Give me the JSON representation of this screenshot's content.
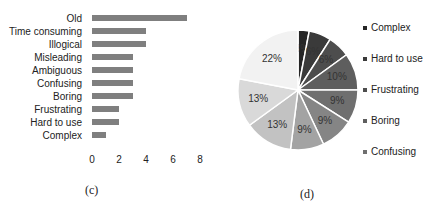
{
  "chart_data": [
    {
      "type": "bar",
      "orientation": "horizontal",
      "title": "",
      "xlabel": "",
      "ylabel": "",
      "categories": [
        "Old",
        "Time consuming",
        "Illogical",
        "Misleading",
        "Ambiguous",
        "Confusing",
        "Boring",
        "Frustrating",
        "Hard to use",
        "Complex"
      ],
      "values": [
        7,
        4,
        4,
        3,
        3,
        3,
        3,
        2,
        2,
        1
      ],
      "xlim": [
        0,
        8
      ],
      "xticks": [
        "0",
        "2",
        "4",
        "6",
        "8"
      ],
      "grid": false,
      "bar_color": "#7f7f7f",
      "caption": "(c)"
    },
    {
      "type": "pie",
      "title": "",
      "labels": [
        "Complex",
        "Hard to use",
        "Frustrating",
        "Boring",
        "Confusing",
        "Ambiguous",
        "Misleading",
        "Illogical",
        "Time consuming",
        "Old"
      ],
      "values": [
        3,
        6,
        6,
        10,
        9,
        9,
        9,
        13,
        13,
        22
      ],
      "value_labels": [
        "3%",
        "6%",
        "6%",
        "10%",
        "9%",
        "9%",
        "9%",
        "13%",
        "13%",
        "22%"
      ],
      "colors": [
        "#262626",
        "#3a3a3a",
        "#4d4d4d",
        "#5e5e5e",
        "#6f6f6f",
        "#858585",
        "#a3a3a3",
        "#c2c2c2",
        "#d9d9d9",
        "#f2f2f2"
      ],
      "legend": [
        "Complex",
        "Hard to use",
        "Frustrating",
        "Boring",
        "Confusing"
      ],
      "legend_position": "right",
      "caption": "(d)"
    }
  ]
}
